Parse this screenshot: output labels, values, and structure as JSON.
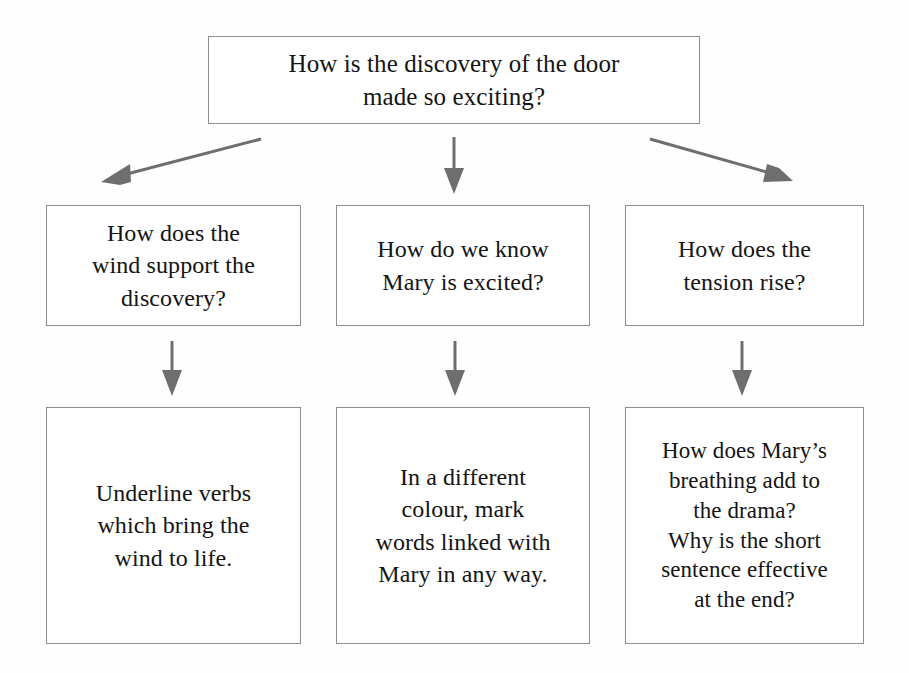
{
  "diagram": {
    "type": "flowchart",
    "title_text": "How is the discovery of the door made so exciting?",
    "root": {
      "id": "root",
      "text": "How is the discovery of the door\nmade so exciting?"
    },
    "branches": [
      {
        "id": "branch-0",
        "question": {
          "id": "mid-0",
          "text": "How does the\nwind support the\ndiscovery?"
        },
        "task": {
          "id": "bot-0",
          "text": "Underline verbs\nwhich bring the\nwind to life."
        },
        "connector_from_root": "diagonal-left-arrow",
        "connector_to_task": "down-arrow"
      },
      {
        "id": "branch-1",
        "question": {
          "id": "mid-1",
          "text": "How do we know\nMary is excited?"
        },
        "task": {
          "id": "bot-1",
          "text": "In a different\ncolour, mark\nwords linked with\nMary in any way."
        },
        "connector_from_root": "down-arrow",
        "connector_to_task": "down-arrow"
      },
      {
        "id": "branch-2",
        "question": {
          "id": "mid-2",
          "text": "How does the\ntension rise?"
        },
        "task": {
          "id": "bot-2",
          "text": "How does Mary’s\nbreathing add to\nthe drama?\nWhy is the short\nsentence effective\nat the end?"
        },
        "connector_from_root": "diagonal-right-arrow",
        "connector_to_task": "down-arrow"
      }
    ],
    "colors": {
      "background": "#fefefe",
      "box_border": "#8d8d8d",
      "box_fill": "#ffffff",
      "text": "#141414",
      "arrow": "#6e6e6e"
    }
  }
}
